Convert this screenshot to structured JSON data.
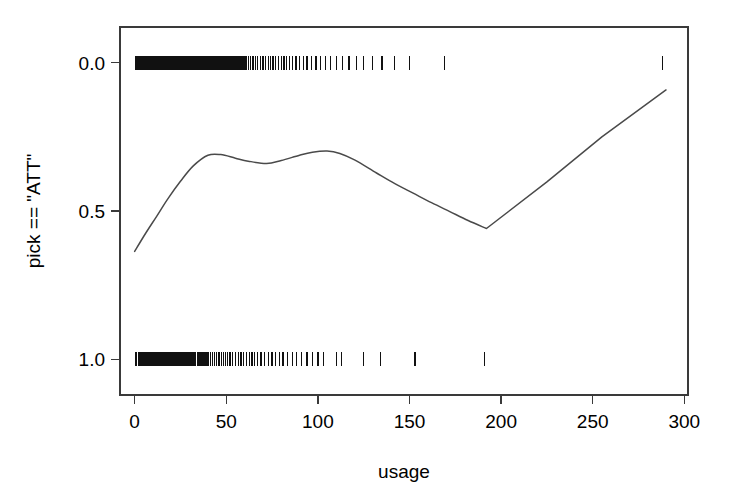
{
  "figure": {
    "background_color": "#ffffff",
    "foreground_color": "#000000",
    "axis_color": "#3a3a3a",
    "curve_color": "#4a4a4a",
    "rug_color": "#111111"
  },
  "axes": {
    "x_title": "usage",
    "y_title": "pick == \"ATT\"",
    "x_ticks": [
      "0",
      "50",
      "100",
      "150",
      "200",
      "250",
      "300"
    ],
    "y_ticks": [
      "1.0",
      "0.5",
      "0.0"
    ]
  },
  "chart_data": {
    "type": "line",
    "title": "",
    "subtitle": "",
    "xlabel": "usage",
    "ylabel": "pick == \"ATT\"",
    "xlim": [
      -8,
      302
    ],
    "ylim": [
      -0.12,
      1.12
    ],
    "xticks": [
      0,
      50,
      100,
      150,
      200,
      250,
      300
    ],
    "yticks": [
      0.0,
      0.5,
      1.0
    ],
    "grid": false,
    "legend": false,
    "legend_position": "none",
    "series": [
      {
        "name": "smoothed fit",
        "kind": "line",
        "x": [
          0,
          6,
          12,
          18,
          25,
          32,
          40,
          47,
          55,
          62,
          72,
          80,
          90,
          97,
          105,
          112,
          120,
          132,
          142,
          152,
          162,
          172,
          182,
          192,
          225,
          255,
          290
        ],
        "values": [
          0.364,
          0.425,
          0.482,
          0.54,
          0.6,
          0.652,
          0.688,
          0.69,
          0.678,
          0.668,
          0.66,
          0.67,
          0.688,
          0.698,
          0.702,
          0.694,
          0.672,
          0.628,
          0.592,
          0.56,
          0.528,
          0.498,
          0.468,
          0.441,
          0.598,
          0.75,
          0.908
        ]
      },
      {
        "name": "rug marks for pick == 1",
        "kind": "rug",
        "y": 1.0,
        "x": [
          0.4,
          1.1,
          1.6,
          2.2,
          2.8,
          3.3,
          3.9,
          4.5,
          5.1,
          5.7,
          6.2,
          6.8,
          7.4,
          8.0,
          8.6,
          9.1,
          9.7,
          10.3,
          10.9,
          11.5,
          12.0,
          12.6,
          13.2,
          13.8,
          14.4,
          14.9,
          15.5,
          16.1,
          16.7,
          17.3,
          17.8,
          18.4,
          19.0,
          19.6,
          20.2,
          20.7,
          21.3,
          21.9,
          22.5,
          23.1,
          23.6,
          24.2,
          24.8,
          25.4,
          26.0,
          26.5,
          27.1,
          27.7,
          28.3,
          28.9,
          29.4,
          30.0,
          30.6,
          31.2,
          31.8,
          32.3,
          32.9,
          33.5,
          34.1,
          34.7,
          35.2,
          35.8,
          36.4,
          37.0,
          37.6,
          38.1,
          38.7,
          39.3,
          39.9,
          40.5,
          41.0,
          41.6,
          42.2,
          42.8,
          43.4,
          43.9,
          44.5,
          45.1,
          45.7,
          46.3,
          46.8,
          47.4,
          48.0,
          48.6,
          49.2,
          49.7,
          50.3,
          50.9,
          51.5,
          52.1,
          52.6,
          53.2,
          53.8,
          54.4,
          55.0,
          55.5,
          56.1,
          56.7,
          57.3,
          57.9,
          58.4,
          59.0,
          59.6,
          60.2,
          61.0,
          62.2,
          63.4,
          64.6,
          65.8,
          67.0,
          68.5,
          70.0,
          71.5,
          73.0,
          74.2,
          75.5,
          77.0,
          78.5,
          80.0,
          81.5,
          83.0,
          84.5,
          86.0,
          88.0,
          90.0,
          92.0,
          94.0,
          96.5,
          99.0,
          101.5,
          104.0,
          107.0,
          110.0,
          113.5,
          117.0,
          121.0,
          125.0,
          130.0,
          135.0,
          142.0,
          150.0,
          169.0,
          288.0
        ]
      },
      {
        "name": "rug marks for pick == 0",
        "kind": "rug",
        "y": 0.0,
        "x": [
          0.5,
          1.2,
          1.9,
          2.6,
          3.3,
          4.0,
          4.7,
          5.4,
          6.1,
          6.8,
          7.5,
          8.2,
          8.9,
          9.6,
          10.3,
          11.0,
          11.7,
          12.4,
          13.1,
          13.8,
          14.5,
          15.2,
          15.9,
          16.6,
          17.3,
          18.0,
          18.7,
          19.4,
          20.1,
          20.8,
          21.5,
          22.2,
          22.9,
          23.6,
          24.3,
          25.0,
          25.7,
          26.4,
          27.1,
          27.8,
          28.5,
          29.2,
          29.9,
          30.6,
          31.3,
          32.0,
          32.7,
          33.4,
          34.1,
          34.8,
          35.5,
          36.2,
          36.9,
          37.6,
          38.3,
          39.0,
          40.0,
          41.2,
          42.4,
          43.6,
          44.8,
          46.0,
          47.2,
          48.4,
          49.6,
          50.8,
          52.0,
          53.5,
          55.0,
          56.5,
          58.0,
          59.5,
          61.0,
          62.5,
          64.0,
          65.5,
          67.0,
          69.0,
          71.0,
          73.0,
          75.0,
          77.0,
          79.0,
          81.0,
          83.5,
          86.0,
          88.5,
          91.0,
          94.0,
          97.0,
          100.0,
          103.0,
          110.0,
          113.0,
          125.0,
          134.0,
          153.0,
          191.0
        ]
      }
    ]
  }
}
